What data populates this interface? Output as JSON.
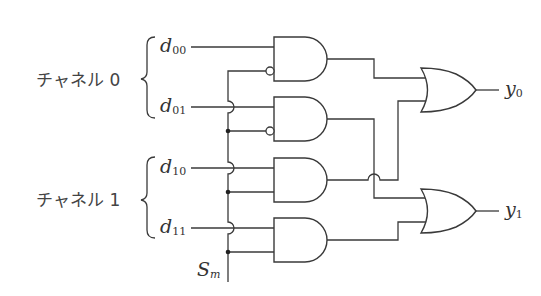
{
  "diagram": {
    "type": "logic-circuit",
    "channels": [
      {
        "label": "チャネル 0",
        "inputs": [
          {
            "base": "d",
            "sub": "00"
          },
          {
            "base": "d",
            "sub": "01"
          }
        ]
      },
      {
        "label": "チャネル 1",
        "inputs": [
          {
            "base": "d",
            "sub": "10"
          },
          {
            "base": "d",
            "sub": "11"
          }
        ]
      }
    ],
    "select": {
      "base": "S",
      "sub": "m"
    },
    "outputs": [
      {
        "base": "y",
        "sub": "0"
      },
      {
        "base": "y",
        "sub": "1"
      }
    ],
    "gates": [
      {
        "id": "and0",
        "type": "AND",
        "inputs": [
          "d00",
          "NOT Sm"
        ],
        "to": "or0"
      },
      {
        "id": "and1",
        "type": "AND",
        "inputs": [
          "d01",
          "NOT Sm"
        ],
        "to": "or1"
      },
      {
        "id": "and2",
        "type": "AND",
        "inputs": [
          "d10",
          "Sm"
        ],
        "to": "or0"
      },
      {
        "id": "and3",
        "type": "AND",
        "inputs": [
          "d11",
          "Sm"
        ],
        "to": "or1"
      },
      {
        "id": "or0",
        "type": "OR",
        "inputs": [
          "and0",
          "and2"
        ],
        "output": "y0"
      },
      {
        "id": "or1",
        "type": "OR",
        "inputs": [
          "and1",
          "and3"
        ],
        "output": "y1"
      }
    ]
  },
  "labels": {
    "ch0": "チャネル 0",
    "ch1": "チャネル 1",
    "d00_base": "d",
    "d00_sub": "00",
    "d01_base": "d",
    "d01_sub": "01",
    "d10_base": "d",
    "d10_sub": "10",
    "d11_base": "d",
    "d11_sub": "11",
    "s_base": "S",
    "s_sub": "m",
    "y0_base": "y",
    "y0_sub": "0",
    "y1_base": "y",
    "y1_sub": "1"
  }
}
